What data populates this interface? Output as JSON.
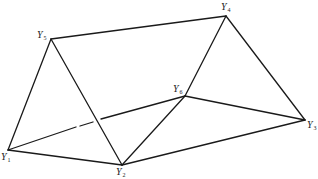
{
  "diagram": {
    "type": "triangular-prism-graph",
    "stroke_color": "#1a1a1a",
    "background": "#ffffff",
    "vertices": [
      {
        "id": "Y1",
        "letter": "Y",
        "sub": "1",
        "x": 8,
        "y": 150,
        "label_x": 1,
        "label_y": 152
      },
      {
        "id": "Y2",
        "letter": "Y",
        "sub": "2",
        "x": 122,
        "y": 165,
        "label_x": 116,
        "label_y": 167
      },
      {
        "id": "Y3",
        "letter": "Y",
        "sub": "3",
        "x": 305,
        "y": 120,
        "label_x": 307,
        "label_y": 119
      },
      {
        "id": "Y4",
        "letter": "Y",
        "sub": "4",
        "x": 226,
        "y": 16,
        "label_x": 222,
        "label_y": 3
      },
      {
        "id": "Y5",
        "letter": "Y",
        "sub": "5",
        "x": 51,
        "y": 39,
        "label_x": 37,
        "label_y": 30
      },
      {
        "id": "Y6",
        "letter": "Y",
        "sub": "6",
        "x": 185,
        "y": 96,
        "label_x": 173,
        "label_y": 84
      }
    ],
    "edges": [
      {
        "from": "Y5",
        "to": "Y4",
        "style": "solid"
      },
      {
        "from": "Y5",
        "to": "Y1",
        "style": "solid"
      },
      {
        "from": "Y5",
        "to": "Y2",
        "style": "solid"
      },
      {
        "from": "Y4",
        "to": "Y6",
        "style": "solid"
      },
      {
        "from": "Y4",
        "to": "Y3",
        "style": "solid"
      },
      {
        "from": "Y1",
        "to": "Y2",
        "style": "solid"
      },
      {
        "from": "Y2",
        "to": "Y3",
        "style": "solid"
      },
      {
        "from": "Y2",
        "to": "Y6",
        "style": "solid"
      },
      {
        "from": "Y6",
        "to": "Y3",
        "style": "solid"
      },
      {
        "from": "Y1",
        "to": "Y6",
        "style": "broken"
      }
    ]
  },
  "labels": {
    "Y1": {
      "letter": "Y",
      "sub": "1"
    },
    "Y2": {
      "letter": "Y",
      "sub": "2"
    },
    "Y3": {
      "letter": "Y",
      "sub": "3"
    },
    "Y4": {
      "letter": "Y",
      "sub": "4"
    },
    "Y5": {
      "letter": "Y",
      "sub": "5"
    },
    "Y6": {
      "letter": "Y",
      "sub": "6"
    }
  }
}
